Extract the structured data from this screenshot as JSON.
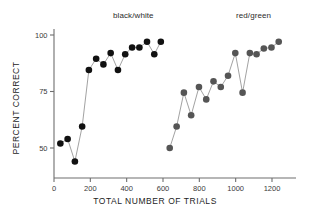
{
  "chart_data": {
    "type": "scatter",
    "title": "",
    "xlabel": "TOTAL NUMBER OF TRIALS",
    "ylabel": "PERCENT CORRECT",
    "xlim": [
      0,
      1290
    ],
    "ylim": [
      40,
      103
    ],
    "xticks": [
      0,
      200,
      400,
      600,
      800,
      1000,
      1200
    ],
    "xticklabels": [
      "0",
      "200",
      "400",
      "600",
      "800",
      "1000",
      "1200"
    ],
    "yticks": [
      50,
      75,
      100
    ],
    "yticklabels": [
      "50",
      "75",
      "100"
    ],
    "grid": false,
    "legend": "none",
    "annotations": [
      {
        "text": "black/white",
        "x": 330,
        "y": 103
      },
      {
        "text": "red/green",
        "x": 1010,
        "y": 103
      }
    ],
    "series": [
      {
        "name": "black/white",
        "color": "#111111",
        "marker": "filled-circle",
        "line": true,
        "points": [
          {
            "x": 35,
            "y": 52
          },
          {
            "x": 75,
            "y": 54
          },
          {
            "x": 115,
            "y": 44
          },
          {
            "x": 155,
            "y": 59.5
          },
          {
            "x": 192,
            "y": 84.5
          },
          {
            "x": 232,
            "y": 89.5
          },
          {
            "x": 272,
            "y": 87
          },
          {
            "x": 312,
            "y": 92
          },
          {
            "x": 352,
            "y": 84.5
          },
          {
            "x": 392,
            "y": 91.5
          },
          {
            "x": 430,
            "y": 94.5
          },
          {
            "x": 470,
            "y": 94.5
          },
          {
            "x": 512,
            "y": 97
          },
          {
            "x": 552,
            "y": 91.5
          },
          {
            "x": 588,
            "y": 97
          }
        ]
      },
      {
        "name": "red/green",
        "color": "#555555",
        "marker": "filled-circle",
        "line": true,
        "points": [
          {
            "x": 637,
            "y": 50
          },
          {
            "x": 675,
            "y": 59.5
          },
          {
            "x": 715,
            "y": 74.5
          },
          {
            "x": 755,
            "y": 64.5
          },
          {
            "x": 798,
            "y": 77
          },
          {
            "x": 838,
            "y": 71.5
          },
          {
            "x": 878,
            "y": 79.5
          },
          {
            "x": 918,
            "y": 77
          },
          {
            "x": 958,
            "y": 82
          },
          {
            "x": 998,
            "y": 92
          },
          {
            "x": 1038,
            "y": 74.5
          },
          {
            "x": 1078,
            "y": 92
          },
          {
            "x": 1115,
            "y": 91.5
          },
          {
            "x": 1155,
            "y": 94
          },
          {
            "x": 1197,
            "y": 94.5
          },
          {
            "x": 1237,
            "y": 97
          }
        ]
      }
    ]
  },
  "colors": {
    "axis": "#6e6e6e",
    "series_black": "#111111",
    "series_gray": "#555555",
    "background": "#ffffff",
    "text": "#222222"
  }
}
